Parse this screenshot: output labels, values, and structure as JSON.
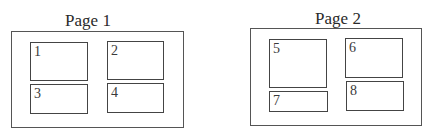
{
  "pages": [
    {
      "title": "Page 1",
      "boxes": [
        {
          "label": "1"
        },
        {
          "label": "2"
        },
        {
          "label": "3"
        },
        {
          "label": "4"
        }
      ]
    },
    {
      "title": "Page 2",
      "boxes": [
        {
          "label": "5"
        },
        {
          "label": "6"
        },
        {
          "label": "7"
        },
        {
          "label": "8"
        }
      ]
    }
  ]
}
